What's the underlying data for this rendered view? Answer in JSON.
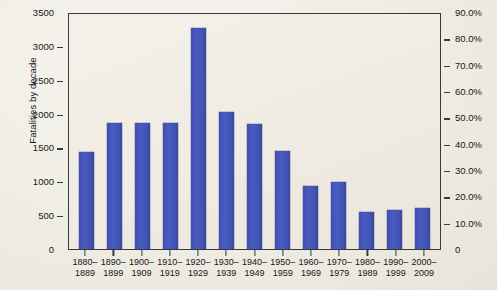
{
  "chart_data": {
    "type": "bar",
    "title": "",
    "xlabel": "",
    "ylabel": "Fatalities by decade",
    "ylabel_right": "",
    "categories": [
      "1880–1889",
      "1890–1899",
      "1900–1909",
      "1910–1919",
      "1920–1929",
      "1930–1939",
      "1940–1949",
      "1950–1959",
      "1960–1969",
      "1970–1979",
      "1980–1989",
      "1990–1999",
      "2000–2009"
    ],
    "category_lines": [
      [
        "1880–",
        "1889"
      ],
      [
        "1890–",
        "1899"
      ],
      [
        "1900–",
        "1909"
      ],
      [
        "1910–",
        "1919"
      ],
      [
        "1920–",
        "1929"
      ],
      [
        "1930–",
        "1939"
      ],
      [
        "1940–",
        "1949"
      ],
      [
        "1950–",
        "1959"
      ],
      [
        "1960–",
        "1969"
      ],
      [
        "1970–",
        "1979"
      ],
      [
        "1980–",
        "1989"
      ],
      [
        "1990–",
        "1999"
      ],
      [
        "2000–",
        "2009"
      ]
    ],
    "values": [
      1430,
      1860,
      1860,
      1860,
      3260,
      2020,
      1840,
      1450,
      930,
      990,
      540,
      580,
      600
    ],
    "ylim": [
      0,
      3500
    ],
    "yticks": [
      0,
      500,
      1000,
      1500,
      2000,
      2500,
      3000,
      3500
    ],
    "ytick_labels": [
      "0",
      "500",
      "1000",
      "1500",
      "2000",
      "2500",
      "3000",
      "3500"
    ],
    "ylim_right": [
      0,
      90
    ],
    "yticks_right": [
      0,
      10,
      20,
      30,
      40,
      50,
      60,
      70,
      80,
      90
    ],
    "ytick_labels_right": [
      "0",
      "10.0%",
      "20.0%",
      "30.0%",
      "40.0%",
      "50.0%",
      "60.0%",
      "70.0%",
      "80.0%",
      "90.0%"
    ],
    "grid": false,
    "legend": null,
    "series": [
      {
        "name": "Fatalities by decade",
        "color": "#4355b8",
        "values": [
          1430,
          1860,
          1860,
          1860,
          3260,
          2020,
          1840,
          1450,
          930,
          990,
          540,
          580,
          600
        ]
      }
    ]
  },
  "colors": {
    "bar": "#4355b8",
    "axis": "#3a3a3c",
    "background": "#efece4",
    "plot_background": "#f1eee6",
    "text": "#17171a"
  }
}
